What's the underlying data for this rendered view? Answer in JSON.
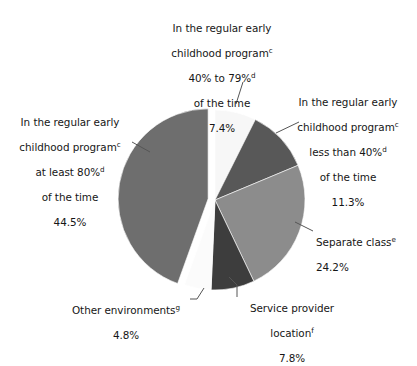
{
  "chart_data": {
    "type": "pie",
    "title": "",
    "subtitle": "",
    "xlabel": "",
    "ylabel": "",
    "legend_position": "none",
    "grid": false,
    "total_percent": 100.0,
    "units": "percent",
    "categories": [
      "In the regular early childhood program 40% to 79% of the time",
      "In the regular early childhood program less than 40% of the time",
      "Separate class",
      "Service provider location",
      "Other environments",
      "In the regular early childhood program at least 80% of the time"
    ],
    "values": [
      7.4,
      11.3,
      24.2,
      7.8,
      4.8,
      44.5
    ],
    "slices": [
      {
        "id": "pct-40-79",
        "line1": "In the regular early",
        "line2": "childhood program",
        "sup2": "c",
        "line3": "40% to 79%",
        "sup3": "d",
        "line4": "of the time",
        "value_label": "7.4%",
        "value": 7.4,
        "color": "#f7f7f7",
        "start_angle": 0.0,
        "end_angle": 26.64
      },
      {
        "id": "pct-lt-40",
        "line1": "In the regular early",
        "line2": "childhood program",
        "sup2": "c",
        "line3": "less than 40%",
        "sup3": "d",
        "line4": "of the time",
        "value_label": "11.3%",
        "value": 11.3,
        "color": "#585858",
        "start_angle": 26.64,
        "end_angle": 67.32
      },
      {
        "id": "separate-class",
        "line1": "Separate class",
        "sup1": "e",
        "value_label": "24.2%",
        "value": 24.2,
        "color": "#8c8c8c",
        "start_angle": 67.32,
        "end_angle": 154.44
      },
      {
        "id": "service-provider",
        "line1": "Service provider",
        "line2": "location",
        "sup2": "f",
        "value_label": "7.8%",
        "value": 7.8,
        "color": "#3d3d3d",
        "start_angle": 154.44,
        "end_angle": 182.52
      },
      {
        "id": "other-environments",
        "line1": "Other environments",
        "sup1": "g",
        "value_label": "4.8%",
        "value": 4.8,
        "color": "#fbfbfb",
        "start_angle": 182.52,
        "end_angle": 199.8
      },
      {
        "id": "pct-at-least-80",
        "line1": "In the regular early",
        "line2": "childhood program",
        "sup2": "c",
        "line3": "at least 80%",
        "sup3": "d",
        "line4": "of the time",
        "value_label": "44.5%",
        "value": 44.5,
        "color": "#6e6e6e",
        "start_angle": 199.8,
        "end_angle": 360.0,
        "exploded": true
      }
    ]
  },
  "labels": {
    "pct_40_79": {
      "l1": "In the regular early",
      "l2": "childhood program",
      "s2": "c",
      "l3": "40% to 79%",
      "s3": "d",
      "l4": "of the time",
      "value": "7.4%"
    },
    "pct_lt_40": {
      "l1": "In the regular early",
      "l2": "childhood program",
      "s2": "c",
      "l3": "less than 40%",
      "s3": "d",
      "l4": "of the time",
      "value": "11.3%"
    },
    "separate_class": {
      "l1": "Separate class",
      "s1": "e",
      "value": "24.2%"
    },
    "service_provider": {
      "l1": "Service provider",
      "l2": "location",
      "s2": "f",
      "value": "7.8%"
    },
    "other_environments": {
      "l1": "Other environments",
      "s1": "g",
      "value": "4.8%"
    },
    "pct_at_least_80": {
      "l1": "In the regular early",
      "l2": "childhood program",
      "s2": "c",
      "l3": "at least 80%",
      "s3": "d",
      "l4": "of the time",
      "value": "44.5%"
    }
  },
  "colors": {
    "background": "#ffffff",
    "text": "#161616",
    "leader_line": "#555555",
    "slice_outline": "#ffffff"
  }
}
